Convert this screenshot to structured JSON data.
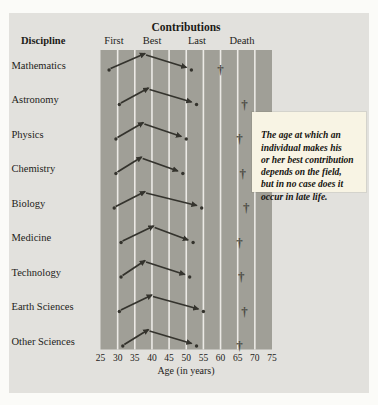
{
  "figure": {
    "title": "Contributions",
    "discipline_header": "Discipline",
    "column_headers": [
      "First",
      "Best",
      "Last",
      "Death"
    ],
    "x_axis_label": "Age (in years)",
    "death_marker_glyph": "†"
  },
  "annotation": {
    "lines": [
      "The age at which an",
      "individual makes his",
      "or her best contribution",
      "depends on the field,",
      "but in no case does it",
      "occur in late life."
    ]
  },
  "chart_data": {
    "type": "line",
    "title": "Contributions",
    "xlabel": "Age (in years)",
    "xlim": [
      25,
      75
    ],
    "x_ticks": [
      25,
      30,
      35,
      40,
      45,
      50,
      55,
      60,
      65,
      70,
      75
    ],
    "grid": "vertical-white-bands",
    "legend_position": "top-column-headers",
    "columns": [
      "First",
      "Best",
      "Last",
      "Death"
    ],
    "rows": [
      {
        "discipline": "Mathematics",
        "first": 27.5,
        "best": 38,
        "last": 51.5,
        "death": 60
      },
      {
        "discipline": "Astronomy",
        "first": 30.5,
        "best": 39,
        "last": 53,
        "death": 67
      },
      {
        "discipline": "Physics",
        "first": 29.5,
        "best": 37.5,
        "last": 50,
        "death": 65.5
      },
      {
        "discipline": "Chemistry",
        "first": 29.5,
        "best": 37,
        "last": 49,
        "death": 66.5
      },
      {
        "discipline": "Biology",
        "first": 29,
        "best": 38,
        "last": 54.5,
        "death": 67.5
      },
      {
        "discipline": "Medicine",
        "first": 31,
        "best": 40.5,
        "last": 52,
        "death": 65.5
      },
      {
        "discipline": "Technology",
        "first": 31,
        "best": 38,
        "last": 51,
        "death": 66
      },
      {
        "discipline": "Earth Sciences",
        "first": 30.5,
        "best": 40,
        "last": 55,
        "death": 67
      },
      {
        "discipline": "Other Sciences",
        "first": 31.5,
        "best": 39,
        "last": 53,
        "death": 65.5
      }
    ]
  },
  "colors": {
    "page_bg": "#fbfbf8",
    "panel_bg": "#e2e1dd",
    "band_fill": "#a09f97",
    "gridline": "#eceae6",
    "ink": "#34332d",
    "text": "#232219",
    "dagger": "#4c4b44",
    "annotation_bg": "#f8f4e4"
  }
}
